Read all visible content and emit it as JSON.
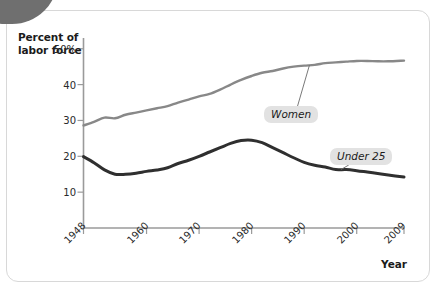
{
  "figure": {
    "background_color": "#ffffff",
    "frame_color": "#d8d8d8",
    "corner_tab_color": "#6f6f6f"
  },
  "axis": {
    "y_title_line1": "Percent of",
    "y_title_line2": "labor force",
    "x_title": "Year",
    "y_ticks": [
      "50%",
      "40",
      "30",
      "20",
      "10"
    ],
    "x_ticks": [
      "1948",
      "1960",
      "1970",
      "1980",
      "1990",
      "2000",
      "2009"
    ],
    "axis_color": "#9a9a9a"
  },
  "callouts": {
    "women": "Women",
    "under25": "Under 25",
    "chip_color": "#e2e2e2"
  },
  "chart_data": {
    "type": "line",
    "title": "",
    "subtitle": "",
    "xlabel": "Year",
    "ylabel": "Percent of labor force",
    "xlim": [
      1948,
      2009
    ],
    "ylim": [
      0,
      53
    ],
    "grid": false,
    "legend_position": "inline-callouts",
    "y_tick_values": [
      10,
      20,
      30,
      40,
      50
    ],
    "y_tick_labels": [
      "10",
      "20",
      "30",
      "40",
      "50%"
    ],
    "x_tick_values": [
      1948,
      1960,
      1970,
      1980,
      1990,
      2000,
      2009
    ],
    "x_tick_labels": [
      "1948",
      "1960",
      "1970",
      "1980",
      "1990",
      "2000",
      "2009"
    ],
    "series": [
      {
        "name": "Women",
        "color": "#888888",
        "line_width": 2.4,
        "x": [
          1948,
          1950,
          1952,
          1954,
          1956,
          1958,
          1960,
          1962,
          1964,
          1966,
          1968,
          1970,
          1972,
          1974,
          1976,
          1978,
          1980,
          1982,
          1984,
          1986,
          1988,
          1990,
          1992,
          1994,
          1996,
          1998,
          2000,
          2002,
          2004,
          2006,
          2009
        ],
        "values": [
          28.6,
          29.6,
          30.8,
          30.6,
          31.6,
          32.2,
          32.8,
          33.4,
          34.0,
          35.0,
          35.8,
          36.7,
          37.4,
          38.6,
          40.0,
          41.3,
          42.4,
          43.3,
          43.8,
          44.5,
          45.0,
          45.3,
          45.5,
          46.0,
          46.2,
          46.4,
          46.6,
          46.6,
          46.5,
          46.5,
          46.7
        ]
      },
      {
        "name": "Under 25",
        "color": "#2f2f2f",
        "line_width": 3.0,
        "x": [
          1948,
          1950,
          1952,
          1954,
          1956,
          1958,
          1960,
          1962,
          1964,
          1966,
          1968,
          1970,
          1972,
          1974,
          1976,
          1978,
          1980,
          1982,
          1984,
          1986,
          1988,
          1990,
          1992,
          1994,
          1996,
          1998,
          2000,
          2002,
          2004,
          2006,
          2009
        ],
        "values": [
          19.9,
          18.2,
          16.2,
          15.0,
          15.0,
          15.3,
          15.8,
          16.2,
          16.8,
          18.0,
          18.9,
          20.0,
          21.2,
          22.4,
          23.6,
          24.4,
          24.5,
          23.8,
          22.4,
          21.0,
          19.6,
          18.3,
          17.5,
          17.0,
          16.3,
          16.3,
          16.0,
          15.6,
          15.2,
          14.8,
          14.2
        ]
      }
    ],
    "annotations": [
      {
        "text": "Women",
        "target_x": 1991,
        "target_y": 45.4
      },
      {
        "text": "Under 25",
        "target_x": 1997,
        "target_y": 16.3
      }
    ]
  }
}
